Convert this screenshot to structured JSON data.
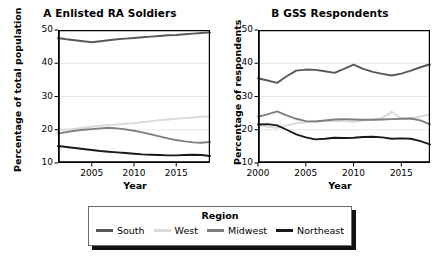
{
  "figure": {
    "width": 440,
    "height": 256,
    "background": "#ffffff"
  },
  "legend": {
    "title": "Region",
    "position": "bottom-center",
    "entries": [
      {
        "label": "South",
        "color": "#595959"
      },
      {
        "label": "West",
        "color": "#d9d9d9"
      },
      {
        "label": "Midwest",
        "color": "#7f7f7f"
      },
      {
        "label": "Northeast",
        "color": "#1a1a1a"
      }
    ]
  },
  "chart_data": [
    {
      "type": "line",
      "panel": "A",
      "title": "A  Enlisted RA Soldiers",
      "xlabel": "Year",
      "ylabel": "Percentage of total population",
      "xlim": [
        2001,
        2019
      ],
      "ylim": [
        10,
        50
      ],
      "xticks": [
        2005,
        2010,
        2015
      ],
      "xtick_labels": [
        "2005",
        "2010",
        "2015"
      ],
      "yticks": [
        10,
        20,
        30,
        40,
        50
      ],
      "ytick_labels": [
        "10",
        "20",
        "30",
        "40",
        "50"
      ],
      "grid": true,
      "x": [
        2001,
        2002,
        2003,
        2004,
        2005,
        2006,
        2007,
        2008,
        2009,
        2010,
        2011,
        2012,
        2013,
        2014,
        2015,
        2016,
        2017,
        2018,
        2019
      ],
      "series": [
        {
          "name": "South",
          "color": "#595959",
          "values": [
            47.6,
            47.2,
            46.9,
            46.6,
            46.3,
            46.6,
            46.9,
            47.2,
            47.4,
            47.6,
            47.8,
            48.0,
            48.2,
            48.4,
            48.5,
            48.7,
            48.9,
            49.1,
            49.3
          ]
        },
        {
          "name": "West",
          "color": "#d9d9d9",
          "values": [
            20.1,
            20.0,
            20.3,
            20.6,
            20.9,
            21.2,
            21.4,
            21.6,
            21.8,
            22.0,
            22.3,
            22.6,
            22.9,
            23.1,
            23.3,
            23.5,
            23.7,
            23.9,
            24.0
          ]
        },
        {
          "name": "Midwest",
          "color": "#7f7f7f",
          "values": [
            18.9,
            19.3,
            19.7,
            20.0,
            20.2,
            20.4,
            20.6,
            20.4,
            20.1,
            19.7,
            19.2,
            18.6,
            18.0,
            17.4,
            16.9,
            16.5,
            16.2,
            16.1,
            16.3
          ]
        },
        {
          "name": "Northeast",
          "color": "#1a1a1a",
          "values": [
            15.1,
            14.8,
            14.5,
            14.2,
            13.9,
            13.6,
            13.4,
            13.2,
            13.0,
            12.8,
            12.6,
            12.5,
            12.4,
            12.3,
            12.3,
            12.4,
            12.5,
            12.4,
            12.1
          ]
        }
      ]
    },
    {
      "type": "line",
      "panel": "B",
      "title": "B  GSS Respondents",
      "xlabel": "Year",
      "ylabel": "Percentage of respondents",
      "xlim": [
        2000,
        2018
      ],
      "ylim": [
        10,
        50
      ],
      "xticks": [
        2000,
        2005,
        2010,
        2015
      ],
      "xtick_labels": [
        "2000",
        "2005",
        "2010",
        "2015"
      ],
      "yticks": [
        10,
        20,
        30,
        40,
        50
      ],
      "ytick_labels": [
        "10",
        "20",
        "30",
        "40",
        "50"
      ],
      "grid": true,
      "x": [
        2000,
        2001,
        2002,
        2003,
        2004,
        2005,
        2006,
        2007,
        2008,
        2009,
        2010,
        2011,
        2012,
        2013,
        2014,
        2015,
        2016,
        2017,
        2018
      ],
      "series": [
        {
          "name": "South",
          "color": "#595959",
          "values": [
            35.5,
            34.8,
            34.1,
            36.1,
            37.8,
            38.1,
            38.0,
            37.6,
            37.1,
            38.3,
            39.6,
            38.3,
            37.4,
            36.8,
            36.3,
            36.9,
            37.8,
            38.8,
            39.7
          ]
        },
        {
          "name": "West",
          "color": "#d9d9d9",
          "values": [
            21.5,
            20.9,
            20.6,
            21.3,
            21.9,
            22.2,
            22.6,
            22.6,
            22.7,
            22.6,
            22.4,
            22.8,
            23.1,
            23.5,
            25.4,
            23.4,
            23.5,
            24.0,
            24.6
          ]
        },
        {
          "name": "Midwest",
          "color": "#7f7f7f",
          "values": [
            23.9,
            24.6,
            25.5,
            24.3,
            23.3,
            22.6,
            22.5,
            22.8,
            23.1,
            23.2,
            23.1,
            23.0,
            23.0,
            23.1,
            23.2,
            23.3,
            23.4,
            22.8,
            21.6
          ]
        },
        {
          "name": "Northeast",
          "color": "#1a1a1a",
          "values": [
            21.6,
            21.7,
            21.3,
            20.0,
            18.6,
            17.7,
            17.1,
            17.3,
            17.6,
            17.5,
            17.6,
            17.8,
            17.9,
            17.7,
            17.3,
            17.4,
            17.3,
            16.6,
            15.6
          ]
        }
      ]
    }
  ]
}
